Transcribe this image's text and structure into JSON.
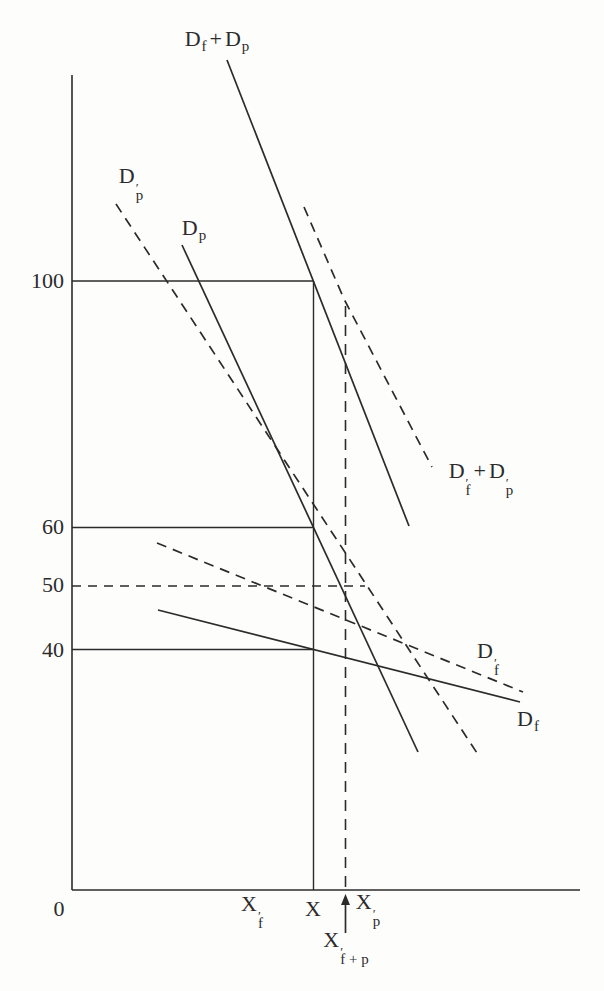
{
  "figure": {
    "ink": "#2b2b2b",
    "background": "#fdfdfc"
  },
  "chart_data": {
    "type": "line",
    "title": "",
    "ink": "#2b2b2b",
    "y_axis": {
      "label": "",
      "ticks": [
        100,
        60,
        50,
        40
      ],
      "tick_pixel_y": [
        281,
        527.5,
        586,
        649.5
      ]
    },
    "x_axis": {
      "label": "",
      "ticks": [
        "0",
        "X'f",
        "X",
        "X'p",
        "X'f+p"
      ],
      "tick_pixel_x": [
        59,
        252,
        313.5,
        367,
        345.5
      ]
    },
    "price_levels": {
      "solid": [
        100,
        60,
        40
      ],
      "dashed": [
        50
      ]
    },
    "quantity_markers": {
      "X_px": 313.5,
      "Xfp_prime_px": 345.5,
      "Xf_prime_px": 252,
      "Xp_prime_px": 367
    },
    "lines": [
      {
        "name": "y-axis",
        "role": "axis",
        "style": "solid",
        "w": 1.6,
        "x1": 72,
        "y1": 75,
        "x2": 72,
        "y2": 890
      },
      {
        "name": "x-axis",
        "role": "axis",
        "style": "solid",
        "w": 1.6,
        "x1": 72,
        "y1": 890,
        "x2": 580,
        "y2": 890
      },
      {
        "name": "price-line-100",
        "role": "guide",
        "style": "solid",
        "w": 1.4,
        "x1": 72,
        "y1": 281,
        "x2": 313.5,
        "y2": 281
      },
      {
        "name": "price-line-60",
        "role": "guide",
        "style": "solid",
        "w": 1.4,
        "x1": 72,
        "y1": 527.5,
        "x2": 313.5,
        "y2": 527.5
      },
      {
        "name": "price-line-50",
        "role": "guide",
        "style": "dashed",
        "w": 1.6,
        "dash": "9 7",
        "x1": 72,
        "y1": 586,
        "x2": 365,
        "y2": 586
      },
      {
        "name": "price-line-40",
        "role": "guide",
        "style": "solid",
        "w": 1.4,
        "x1": 72,
        "y1": 649.5,
        "x2": 313.5,
        "y2": 649.5
      },
      {
        "name": "quantity-line-X",
        "role": "guide",
        "style": "solid",
        "w": 1.4,
        "x1": 313.5,
        "y1": 281,
        "x2": 313.5,
        "y2": 890
      },
      {
        "name": "quantity-line-Xfp",
        "role": "guide",
        "style": "dashed",
        "w": 1.6,
        "dash": "11 8",
        "x1": 345.5,
        "y1": 306,
        "x2": 345.5,
        "y2": 890
      },
      {
        "name": "curve-df-plus-dp",
        "role": "curve",
        "style": "solid",
        "w": 1.7,
        "x1": 227,
        "y1": 60,
        "x2": 409,
        "y2": 526
      },
      {
        "name": "curve-dfp-plus-dpp",
        "role": "curve",
        "style": "dashed",
        "w": 1.7,
        "points": [
          [
            304,
            207
          ],
          [
            344,
            299
          ],
          [
            432,
            467
          ]
        ]
      },
      {
        "name": "curve-dp",
        "role": "curve",
        "style": "solid",
        "w": 1.7,
        "x1": 182,
        "y1": 245,
        "x2": 418,
        "y2": 752
      },
      {
        "name": "curve-dp-prime",
        "role": "curve",
        "style": "dashed",
        "w": 1.7,
        "x1": 116,
        "y1": 204,
        "x2": 477,
        "y2": 753
      },
      {
        "name": "curve-df",
        "role": "curve",
        "style": "solid",
        "w": 1.7,
        "x1": 158,
        "y1": 610,
        "x2": 520,
        "y2": 702
      },
      {
        "name": "curve-df-prime",
        "role": "curve",
        "style": "dashed",
        "w": 1.7,
        "x1": 157,
        "y1": 543,
        "x2": 523,
        "y2": 692
      }
    ],
    "arrow": {
      "x": 345.5,
      "from_y": 933,
      "to_y": 900,
      "tip_y": 894,
      "direction": "up"
    }
  },
  "labels": {
    "sum": {
      "d1": "D",
      "d1sub": "f",
      "plus": "+",
      "d2": "D",
      "d2sub": "p"
    },
    "sum_prime": {
      "d1": "D",
      "d1prime": "′",
      "d1sub": "f",
      "plus": "+",
      "d2": "D",
      "d2prime": "′",
      "d2sub": "p"
    },
    "dp_prime": {
      "d": "D",
      "prime": "′",
      "sub": "p"
    },
    "dp": {
      "d": "D",
      "sub": "p"
    },
    "df_prime": {
      "d": "D",
      "prime": "′",
      "sub": "f"
    },
    "df": {
      "d": "D",
      "sub": "f"
    }
  },
  "axis_labels": {
    "origin": "0",
    "y100": "100",
    "y60": "60",
    "y50": "50",
    "y40": "40",
    "x": {
      "base": "X"
    },
    "xf": {
      "base": "X",
      "prime": "′",
      "sub": "f"
    },
    "xp": {
      "base": "X",
      "prime": "′",
      "sub": "p"
    },
    "xfp": {
      "base": "X",
      "prime": "′",
      "sub": "f + p"
    }
  }
}
